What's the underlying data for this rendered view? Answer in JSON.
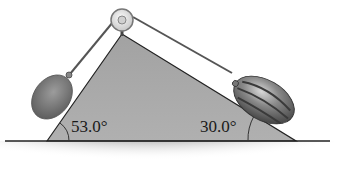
{
  "figure": {
    "left_incline": {
      "angle_label": "53.0°",
      "angle_deg": 53.0,
      "object": "cantaloupe"
    },
    "right_incline": {
      "angle_label": "30.0°",
      "angle_deg": 30.0,
      "object": "watermelon"
    },
    "pulley": {
      "position": "apex"
    }
  },
  "colors": {
    "incline_fill": "#a8a8a8",
    "ground_shade": "#9a9a9a",
    "outline": "#222222",
    "rope": "#555555",
    "melon_left": "#7d7d7d",
    "melon_right": "#6e6e6e",
    "pulley_fill": "#e6e6e6"
  }
}
